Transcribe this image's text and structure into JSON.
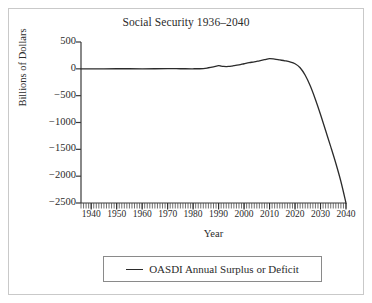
{
  "chart_data": {
    "type": "line",
    "title": "Social Security 1936–2040",
    "xlabel": "Year",
    "ylabel": "Billions of Dollars",
    "xlim": [
      1936,
      2040
    ],
    "ylim": [
      -2500,
      500
    ],
    "grid": false,
    "legend_position": "bottom",
    "xticks": [
      1940,
      1950,
      1960,
      1970,
      1980,
      1990,
      2000,
      2010,
      2020,
      2030,
      2040
    ],
    "xtick_labels": [
      "1940",
      "1950",
      "1960",
      "1970",
      "1980",
      "1990",
      "2000",
      "2010",
      "2020",
      "2030",
      "2040"
    ],
    "minor_xtick_interval": 1,
    "yticks": [
      500,
      0,
      -500,
      -1000,
      -1500,
      -2000,
      -2500
    ],
    "ytick_labels": [
      "500",
      "0",
      "−500",
      "−1000",
      "−1500",
      "−2000",
      "−2500"
    ],
    "series": [
      {
        "name": "OASDI Annual Surplus or Deficit",
        "color": "#2b2b2b",
        "x": [
          1936,
          1940,
          1945,
          1950,
          1955,
          1960,
          1965,
          1970,
          1975,
          1980,
          1984,
          1986,
          1988,
          1990,
          1991,
          1992,
          1993,
          1994,
          1995,
          1996,
          1998,
          2000,
          2002,
          2004,
          2006,
          2008,
          2010,
          2012,
          2014,
          2016,
          2018,
          2020,
          2022,
          2024,
          2026,
          2028,
          2030,
          2032,
          2034,
          2036,
          2038,
          2040
        ],
        "values": [
          0,
          0,
          1,
          2,
          2,
          1,
          2,
          3,
          2,
          1,
          5,
          20,
          38,
          58,
          50,
          45,
          43,
          45,
          50,
          58,
          75,
          95,
          115,
          130,
          150,
          170,
          190,
          180,
          165,
          150,
          130,
          95,
          20,
          -120,
          -320,
          -570,
          -850,
          -1150,
          -1450,
          -1760,
          -2100,
          -2500
        ]
      }
    ]
  },
  "legend": {
    "items": [
      {
        "label": "OASDI Annual Surplus or Deficit",
        "marker": "line-marker"
      }
    ]
  }
}
